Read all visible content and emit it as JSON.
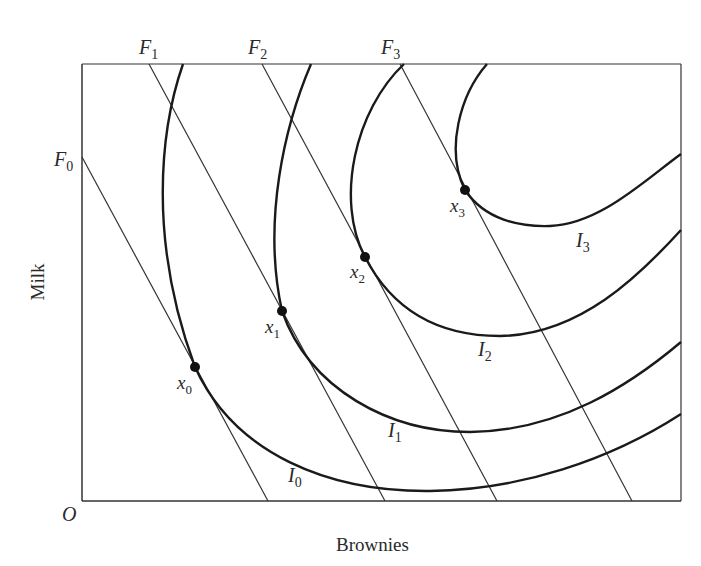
{
  "chart_data": {
    "type": "diagram",
    "title": "",
    "xlabel": "Brownies",
    "ylabel": "Milk",
    "origin_label": "O",
    "frame": {
      "left": 82,
      "top": 64,
      "right": 681,
      "bottom": 501
    },
    "budget_lines": [
      {
        "name": "F",
        "sub": "0",
        "x1": 82,
        "y1": 157,
        "x2": 268,
        "y2": 501,
        "label_x": 54,
        "label_y": 166
      },
      {
        "name": "F",
        "sub": "1",
        "x1": 149,
        "y1": 64,
        "x2": 385,
        "y2": 501,
        "label_x": 139,
        "label_y": 54
      },
      {
        "name": "F",
        "sub": "2",
        "x1": 262,
        "y1": 64,
        "x2": 497,
        "y2": 501,
        "label_x": 248,
        "label_y": 54
      },
      {
        "name": "F",
        "sub": "3",
        "x1": 400,
        "y1": 64,
        "x2": 632,
        "y2": 501,
        "label_x": 381,
        "label_y": 54
      }
    ],
    "indifference_curves": [
      {
        "name": "I",
        "sub": "0",
        "path": "M183,64 C160,130 148,240 195,367 C235,455 330,492 430,491 C520,490 610,460 681,414",
        "label_x": 288,
        "label_y": 482
      },
      {
        "name": "I",
        "sub": "1",
        "path": "M311,64 C285,125 262,220 282,311 C310,390 390,432 470,432 C560,431 630,385 681,342",
        "label_x": 388,
        "label_y": 437
      },
      {
        "name": "I",
        "sub": "2",
        "path": "M404,64 C355,110 335,200 365,257 C395,315 445,336 500,336 C580,335 640,275 681,230",
        "label_x": 478,
        "label_y": 356
      },
      {
        "name": "I",
        "sub": "3",
        "path": "M487,64 C460,95 445,150 465,190 C485,220 520,227 550,226 C600,224 645,180 681,154",
        "label_x": 576,
        "label_y": 247
      }
    ],
    "optimal_points": [
      {
        "name": "x",
        "sub": "0",
        "cx": 195,
        "cy": 367,
        "label_x": 177,
        "label_y": 389
      },
      {
        "name": "x",
        "sub": "1",
        "cx": 282,
        "cy": 311,
        "label_x": 265,
        "label_y": 333
      },
      {
        "name": "x",
        "sub": "2",
        "cx": 365,
        "cy": 257,
        "label_x": 350,
        "label_y": 278
      },
      {
        "name": "x",
        "sub": "3",
        "cx": 465,
        "cy": 190,
        "label_x": 450,
        "label_y": 212
      }
    ]
  }
}
